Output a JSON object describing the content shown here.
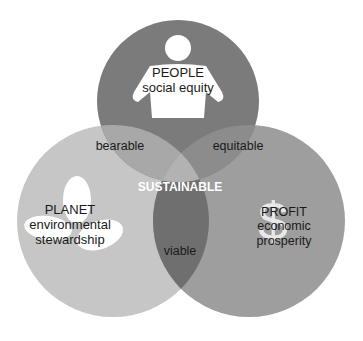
{
  "diagram": {
    "type": "venn-3",
    "colors": {
      "people": "#7a7a7a",
      "planet": "#c4c4c4",
      "profit": "#9c9c9c",
      "people_planet": "#a6a6a6",
      "people_profit": "#8a8a8a",
      "planet_profit": "#6e6e6e",
      "center": "#b0b0b0"
    },
    "circles": [
      {
        "id": "people",
        "title": "PEOPLE",
        "subtitle": "social equity",
        "icon": "person-icon"
      },
      {
        "id": "planet",
        "title": "PLANET",
        "subtitle_line1": "environmental",
        "subtitle_line2": "stewardship",
        "icon": "leaf-icon"
      },
      {
        "id": "profit",
        "title": "PROFIT",
        "subtitle_line1": "economic",
        "subtitle_line2": "prosperity",
        "icon": "dollar-icon"
      }
    ],
    "overlaps": {
      "people_planet": "bearable",
      "people_profit": "equitable",
      "planet_profit": "viable",
      "center": "SUSTAINABLE"
    }
  }
}
